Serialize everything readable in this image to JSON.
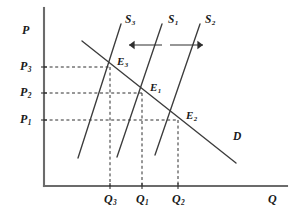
{
  "figure": {
    "kind": "supply-demand-diagram",
    "background_color": "#ffffff",
    "ink_color": "#3c3c3c",
    "text_color": "#1a1a1a"
  },
  "axes": {
    "y_axis_label": "P",
    "x_axis_label": "Q",
    "origin": [
      44,
      186
    ],
    "y_top": 8,
    "x_right": 287,
    "axis_color": "#6b6b6b"
  },
  "price_ticks": [
    {
      "label": "P",
      "sub": "3",
      "y": 67
    },
    {
      "label": "P",
      "sub": "2",
      "y": 93
    },
    {
      "label": "P",
      "sub": "1",
      "y": 120
    }
  ],
  "quantity_ticks": [
    {
      "label": "Q",
      "sub": "3",
      "x": 110
    },
    {
      "label": "Q",
      "sub": "1",
      "x": 142
    },
    {
      "label": "Q",
      "sub": "2",
      "x": 178
    }
  ],
  "supply_curves": [
    {
      "name": "S",
      "sub": "3",
      "label_x": 125,
      "label_y": 14,
      "x1": 121,
      "y1": 24,
      "x2": 78,
      "y2": 158
    },
    {
      "name": "S",
      "sub": "1",
      "label_x": 168,
      "label_y": 14,
      "x1": 162,
      "y1": 24,
      "x2": 117,
      "y2": 157
    },
    {
      "name": "S",
      "sub": "2",
      "label_x": 205,
      "label_y": 14,
      "x1": 200,
      "y1": 24,
      "x2": 155,
      "y2": 155
    }
  ],
  "demand_curve": {
    "name": "D",
    "label_x": 233,
    "label_y": 131,
    "x1": 82,
    "y1": 41,
    "x2": 236,
    "y2": 163
  },
  "equilibria": [
    {
      "name": "E",
      "sub": "3",
      "point_x": 110,
      "point_y": 67,
      "label_x": 117,
      "label_y": 56
    },
    {
      "name": "E",
      "sub": "1",
      "point_x": 142,
      "point_y": 93,
      "label_x": 150,
      "label_y": 82
    },
    {
      "name": "E",
      "sub": "2",
      "point_x": 178,
      "point_y": 120,
      "label_x": 186,
      "label_y": 110
    }
  ],
  "shift_arrows": [
    {
      "direction": "left",
      "x_from": 162,
      "x_to": 129,
      "y": 45
    },
    {
      "direction": "right",
      "x_from": 170,
      "x_to": 203,
      "y": 45
    }
  ],
  "guide_lines": {
    "style": "dashed",
    "dash_pattern": "3,2.6",
    "color": "#2e2e2e"
  }
}
